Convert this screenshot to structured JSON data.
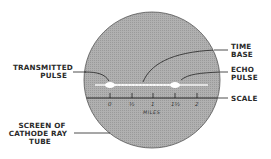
{
  "diagram": {
    "type": "radar-display-schematic",
    "colors": {
      "background": "#ffffff",
      "screen_fill": "#a9a9a9",
      "screen_edge": "#555555",
      "line": "#222222",
      "trace": "#f2f2f2",
      "text": "#2a2a2a"
    },
    "labels": {
      "time_base": [
        "TIME",
        "BASE"
      ],
      "transmitted_pulse": [
        "TRANSMITTED",
        "PULSE"
      ],
      "echo_pulse": [
        "ECHO",
        "PULSE"
      ],
      "scale": "SCALE",
      "screen": [
        "SCREEN OF",
        "CATHODE RAY",
        "TUBE"
      ]
    },
    "scale": {
      "unit_label": "MILES",
      "ticks": [
        "0",
        "½",
        "1",
        "1½",
        "2"
      ]
    }
  }
}
